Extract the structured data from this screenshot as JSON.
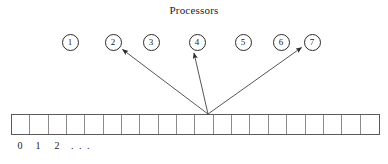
{
  "figure": {
    "title": "Processors",
    "processors": [
      {
        "label": "1",
        "cx": 70,
        "cy": 42
      },
      {
        "label": "2",
        "cx": 113,
        "cy": 42
      },
      {
        "label": "3",
        "cx": 151,
        "cy": 42
      },
      {
        "label": "4",
        "cx": 197,
        "cy": 42
      },
      {
        "label": "5",
        "cx": 243,
        "cy": 42
      },
      {
        "label": "6",
        "cx": 281,
        "cy": 42
      },
      {
        "label": "7",
        "cx": 312,
        "cy": 42
      }
    ],
    "array": {
      "cell_count": 20,
      "index_labels": [
        "0",
        "1",
        "2",
        ". . ."
      ]
    },
    "arrows": {
      "origin": {
        "x": 208,
        "y": 114
      },
      "targets": [
        {
          "to": "2",
          "x": 121,
          "y": 48
        },
        {
          "to": "4",
          "x": 193,
          "y": 51
        },
        {
          "to": "7",
          "x": 303,
          "y": 46
        }
      ]
    },
    "colors": {
      "stroke": "#2b2b2b",
      "cell_border": "#8c8c8c",
      "outer_border": "#5a5a5a",
      "text": "#1a1a1a",
      "background": "#ffffff"
    }
  }
}
